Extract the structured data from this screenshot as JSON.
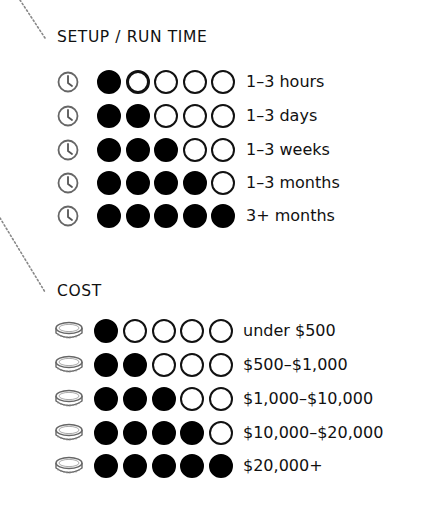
{
  "sections": [
    {
      "id": "setup",
      "heading": "SETUP / RUN TIME",
      "icon": "clock-icon",
      "rows": [
        {
          "filled": 1,
          "label": "1–3 hours",
          "highlight_index": 1
        },
        {
          "filled": 2,
          "label": "1–3 days"
        },
        {
          "filled": 3,
          "label": "1–3 weeks"
        },
        {
          "filled": 4,
          "label": "1–3 months"
        },
        {
          "filled": 5,
          "label": "3+ months"
        }
      ]
    },
    {
      "id": "cost",
      "heading": "COST",
      "icon": "coin-icon",
      "rows": [
        {
          "filled": 1,
          "label": "under $500"
        },
        {
          "filled": 2,
          "label": "$500–$1,000"
        },
        {
          "filled": 3,
          "label": "$1,000–$10,000"
        },
        {
          "filled": 4,
          "label": "$10,000–$20,000"
        },
        {
          "filled": 5,
          "label": "$20,000+"
        }
      ]
    }
  ],
  "scale_max": 5,
  "colors": {
    "filled": "#000000",
    "outline": "#111111",
    "icon": "#666666",
    "dotted_line": "#888888"
  }
}
